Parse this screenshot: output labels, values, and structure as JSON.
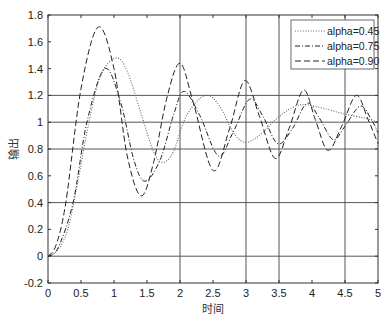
{
  "chart_data": {
    "type": "line",
    "title": "",
    "xlabel": "时间",
    "ylabel": "输出",
    "xlim": [
      0,
      5
    ],
    "ylim": [
      -0.2,
      1.8
    ],
    "xticks": [
      0,
      0.5,
      1,
      1.5,
      2,
      2.5,
      3,
      3.5,
      4,
      4.5,
      5
    ],
    "xtick_labels": [
      "0",
      "0.5",
      "1",
      "1.5",
      "2",
      "2.5",
      "3",
      "3.5",
      "4",
      "4.5",
      "5"
    ],
    "yticks": [
      -0.2,
      0,
      0.2,
      0.4,
      0.6,
      0.8,
      1,
      1.2,
      1.4,
      1.6,
      1.8
    ],
    "ytick_labels": [
      "-0.2",
      "0",
      "0.2",
      "0.4",
      "0.6",
      "0.8",
      "1",
      "1.2",
      "1.4",
      "1.6",
      "1.8"
    ],
    "grid": {
      "horizontal": [
        0,
        0.4,
        0.8,
        1.0,
        1.2
      ],
      "vertical": [
        2,
        3,
        3.5,
        4.5
      ]
    },
    "legend_position": "upper right",
    "series": [
      {
        "name": "alpha=0.45",
        "style": "dotted",
        "x": [
          0,
          0.15,
          0.3,
          0.45,
          0.62,
          0.8,
          1.03,
          1.2,
          1.4,
          1.6,
          1.74,
          1.9,
          2.1,
          2.38,
          2.6,
          2.8,
          2.98,
          3.2,
          3.45,
          3.7,
          3.9,
          4.2,
          4.5,
          4.8,
          5.0
        ],
        "y": [
          0,
          0.05,
          0.2,
          0.55,
          1.0,
          1.35,
          1.48,
          1.38,
          1.08,
          0.78,
          0.7,
          0.78,
          1.05,
          1.2,
          1.12,
          0.93,
          0.85,
          0.9,
          1.02,
          1.11,
          1.13,
          1.1,
          1.06,
          1.03,
          1.0
        ]
      },
      {
        "name": "alpha=0.75",
        "style": "dashdot",
        "x": [
          0,
          0.15,
          0.38,
          0.59,
          0.86,
          1.1,
          1.3,
          1.47,
          1.7,
          1.9,
          2.06,
          2.3,
          2.58,
          2.8,
          3.05,
          3.25,
          3.48,
          3.7,
          3.92,
          4.1,
          4.32,
          4.5,
          4.73,
          4.9,
          5.0
        ],
        "y": [
          0,
          0.06,
          0.4,
          1.0,
          1.4,
          1.15,
          0.72,
          0.56,
          0.72,
          1.05,
          1.23,
          1.05,
          0.75,
          0.92,
          1.17,
          1.05,
          0.84,
          0.95,
          1.14,
          1.04,
          0.87,
          0.97,
          1.12,
          1.02,
          0.92
        ]
      },
      {
        "name": "alpha=0.90",
        "style": "dashed",
        "x": [
          0,
          0.12,
          0.27,
          0.5,
          0.76,
          1.0,
          1.2,
          1.41,
          1.6,
          1.8,
          2.0,
          2.2,
          2.5,
          2.75,
          2.98,
          3.2,
          3.44,
          3.65,
          3.87,
          4.05,
          4.24,
          4.45,
          4.67,
          4.85,
          5.0
        ],
        "y": [
          0,
          0.08,
          0.4,
          1.25,
          1.71,
          1.4,
          0.75,
          0.45,
          0.7,
          1.18,
          1.44,
          1.15,
          0.64,
          0.95,
          1.31,
          1.05,
          0.73,
          0.95,
          1.24,
          1.02,
          0.79,
          0.97,
          1.2,
          1.02,
          0.84
        ]
      }
    ]
  }
}
